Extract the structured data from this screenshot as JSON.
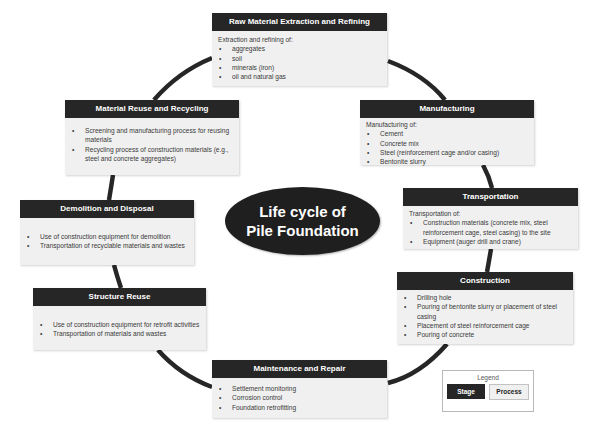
{
  "center": {
    "line1": "Life cycle of",
    "line2": "Pile Foundation"
  },
  "colors": {
    "stage": "#262626",
    "process": "#f0f0f0",
    "arc": "#262626"
  },
  "stages": [
    {
      "title": "Raw Material Extraction and Refining",
      "intro": "Extraction and refining of:",
      "items": [
        "aggregates",
        "soil",
        "minerals (iron)",
        "oil and natural gas"
      ]
    },
    {
      "title": "Manufacturing",
      "intro": "Manufacturing of:",
      "items": [
        "Cement",
        "Concrete mix",
        "Steel (reinforcement cage and/or casing)",
        "Bentonite slurry"
      ]
    },
    {
      "title": "Transportation",
      "intro": "Transportation of:",
      "items": [
        "Construction materials (concrete mix, steel reinforcement cage, steel casing) to the site",
        "Equipment (auger drill and crane)"
      ]
    },
    {
      "title": "Construction",
      "items": [
        "Drilling hole",
        "Pouring of bentonite slurry or placement of steel casing",
        "Placement of steel reinforcement cage",
        "Pouring of concrete"
      ]
    },
    {
      "title": "Maintenance and Repair",
      "items": [
        "Settlement monitoring",
        "Corrosion control",
        "Foundation retrofitting"
      ]
    },
    {
      "title": "Structure Reuse",
      "items": [
        "Use of construction equipment for retrofit activities",
        "Transportation of materials and wastes"
      ]
    },
    {
      "title": "Demolition and Disposal",
      "items": [
        "Use of construction equipment for demolition",
        "Transportation of recyclable materials and wastes"
      ]
    },
    {
      "title": "Material Reuse and Recycling",
      "items": [
        "Screening and manufacturing process for reusing materials",
        "Recycling process of construction materials (e.g., steel and concrete aggregates)"
      ]
    }
  ],
  "legend": {
    "title": "Legend",
    "stage_label": "Stage",
    "process_label": "Process"
  }
}
